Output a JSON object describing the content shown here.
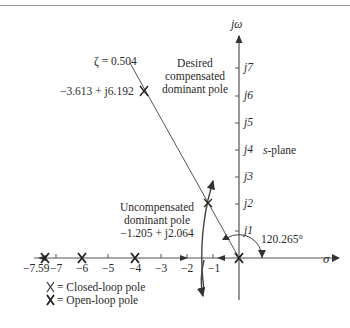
{
  "figure": {
    "axes": {
      "imag_axis_label": "jω",
      "real_axis_label": "σ",
      "plane_label": "s-plane",
      "real_ticks": [
        {
          "value": -7.59,
          "label": "−7.59"
        },
        {
          "value": -7,
          "label": "−7"
        },
        {
          "value": -6,
          "label": "−6"
        },
        {
          "value": -5,
          "label": "−5"
        },
        {
          "value": -4,
          "label": "−4"
        },
        {
          "value": -3,
          "label": "−3"
        },
        {
          "value": -2,
          "label": "−2"
        },
        {
          "value": -1,
          "label": "−1"
        }
      ],
      "imag_ticks": [
        {
          "value": 1,
          "label": "j1"
        },
        {
          "value": 2,
          "label": "j2"
        },
        {
          "value": 3,
          "label": "j3"
        },
        {
          "value": 4,
          "label": "j4"
        },
        {
          "value": 5,
          "label": "j5"
        },
        {
          "value": 6,
          "label": "j6"
        },
        {
          "value": 7,
          "label": "j7"
        }
      ]
    },
    "annotations": {
      "zeta": "ζ = 0.504",
      "desired_pole_value": "−3.613 + j6.192",
      "desired_pole_title": [
        "Desired",
        "compensated",
        "dominant pole"
      ],
      "uncompensated_title": [
        "Uncompensated",
        "dominant pole"
      ],
      "uncompensated_value": "−1.205 + j2.064",
      "angle": "120.265°"
    },
    "legend": {
      "closed_loop": "= Closed-loop pole",
      "open_loop": "= Open-loop pole"
    },
    "poles": {
      "closed_loop_real": [
        0,
        -4,
        -6,
        -7.59
      ],
      "open_loop_real": [
        0,
        -4,
        -6
      ],
      "desired_compensated": {
        "re": -3.613,
        "im": 6.192
      },
      "uncompensated": {
        "re": -1.205,
        "im": 2.064
      }
    }
  }
}
